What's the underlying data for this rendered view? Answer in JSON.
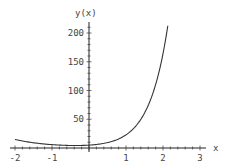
{
  "chart_data": {
    "type": "line",
    "title": "",
    "xlabel": "x",
    "ylabel": "y(x)",
    "xlim": [
      -2,
      3
    ],
    "ylim": [
      0,
      210
    ],
    "x_ticks": [
      "-2",
      "-1",
      "1",
      "2",
      "3"
    ],
    "y_ticks": [
      "50",
      "100",
      "150",
      "200"
    ],
    "grid": false,
    "legend": null,
    "series": [
      {
        "name": "y(x)",
        "x": [
          -2,
          -1.5,
          -1,
          -0.5,
          0,
          0.5,
          1,
          1.5,
          1.75,
          2,
          2.13
        ],
        "values": [
          15,
          9,
          6,
          4.5,
          5,
          9.3,
          23,
          61,
          100,
          164,
          213
        ]
      }
    ],
    "colors": {
      "curve": "#333333",
      "axis": "#222222",
      "text": "#444444"
    }
  }
}
